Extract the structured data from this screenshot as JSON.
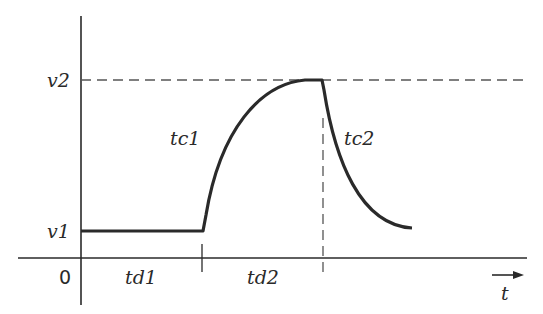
{
  "diagram": {
    "colors": {
      "stroke": "#2a2a2a",
      "dash": "#555555",
      "background": "#ffffff"
    },
    "labels": {
      "v1": "v1",
      "v2": "v2",
      "origin": "0",
      "td1": "td1",
      "td2": "td2",
      "tc1": "tc1",
      "tc2": "tc2",
      "t_axis": "t"
    },
    "segments": [
      {
        "name": "initial-level",
        "from": "0",
        "to": "td1",
        "level": "v1"
      },
      {
        "name": "rise",
        "from": "td1",
        "to": "td2",
        "time_constant": "tc1",
        "target": "v2"
      },
      {
        "name": "fall",
        "from": "td2",
        "time_constant": "tc2",
        "target": "v1"
      }
    ]
  }
}
